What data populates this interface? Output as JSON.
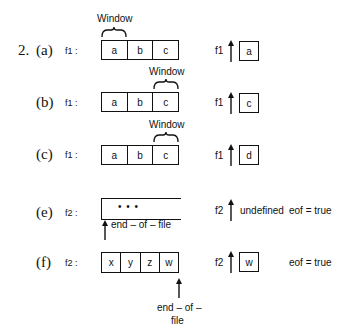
{
  "problem_number": "2.",
  "window_label": "Window",
  "parts": [
    {
      "label": "(a)",
      "file": "f1 :",
      "cells": [
        "a",
        "b",
        "c"
      ],
      "window_cell": 0,
      "pointer_file": "f1",
      "pointer_value": "a"
    },
    {
      "label": "(b)",
      "file": "f1 :",
      "cells": [
        "a",
        "b",
        "c"
      ],
      "window_cell": 2,
      "pointer_file": "f1",
      "pointer_value": "c"
    },
    {
      "label": "(c)",
      "file": "f1 :",
      "cells": [
        "a",
        "b",
        "c"
      ],
      "window_cell": 2,
      "pointer_file": "f1",
      "pointer_value": "d"
    },
    {
      "label": "(e)",
      "file": "f2 :",
      "cells_text": "•   •   •",
      "eof_marker": "end – of – file",
      "pointer_file": "f2",
      "pointer_value": "undefined",
      "eof_status": "eof = true"
    },
    {
      "label": "(f)",
      "file": "f2 :",
      "cells": [
        "x",
        "y",
        "z",
        "w"
      ],
      "eof_marker_line1": "end – of –",
      "eof_marker_line2": "file",
      "pointer_file": "f2",
      "pointer_value": "w",
      "eof_status": "eof = true"
    }
  ]
}
